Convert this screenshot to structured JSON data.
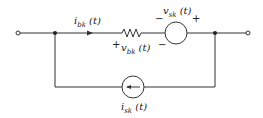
{
  "diagram": {
    "type": "circuit",
    "labels": {
      "i_bk": {
        "sym": "i",
        "sub": "bk",
        "arg": " (t)"
      },
      "v_bk": {
        "sym": "v",
        "sub": "bk",
        "arg": " (t)"
      },
      "v_sk": {
        "sym": "v",
        "sub": "sk",
        "arg": " (t)"
      },
      "i_sk": {
        "sym": "i",
        "sub": "sk",
        "arg": " (t)"
      }
    },
    "signs": {
      "plus": "+",
      "minus": "−"
    },
    "components": [
      "resistor",
      "voltage-source",
      "current-source"
    ],
    "line_color": "#333333"
  }
}
